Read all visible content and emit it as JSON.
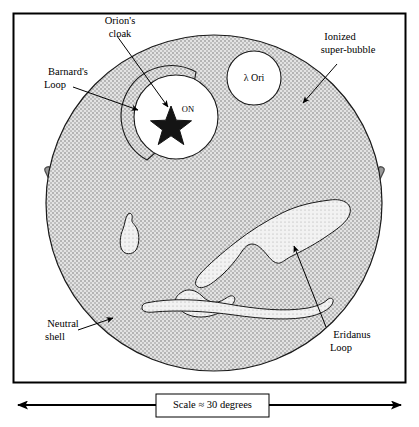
{
  "figure": {
    "frame_color": "#000000",
    "background_color": "#ffffff"
  },
  "colors": {
    "ionized_fill": "#d9d9d9",
    "stipple_dot": "#6e6e6e",
    "neutral_shell": "#9a9a9a",
    "neutral_shell_outline": "#4d4d4d",
    "outline": "#1a1a1a",
    "cavity_fill": "#ffffff",
    "star_fill": "#141414",
    "text": "#000000"
  },
  "labels": {
    "orions_cloak": "Orion's\ncloak",
    "orions_cloak_line1": "Orion's",
    "orions_cloak_line2": "cloak",
    "barnards_loop_line1": "Barnard's",
    "barnards_loop_line2": "Loop",
    "ionized_bubble_line1": "Ionized",
    "ionized_bubble_line2": "super-bubble",
    "lambda_ori": "λ Ori",
    "orion_nebula": "ON",
    "neutral_shell_line1": "Neutral",
    "neutral_shell_line2": "shell",
    "eridanus_loop_line1": "Eridanus",
    "eridanus_loop_line2": "Loop"
  },
  "scalebar": {
    "text": "Scale ≈ 30 degrees",
    "value": 30,
    "unit": "degrees",
    "approximate": true,
    "arrow_style": "double-headed"
  },
  "features": [
    {
      "name": "ionized-super-bubble",
      "kind": "circle",
      "description": "Large stippled circle filling most of the frame",
      "cx": 214,
      "cy": 203,
      "r": 168
    },
    {
      "name": "lambda-ori-cavity",
      "kind": "circle",
      "description": "Small white circular cavity upper right of centre",
      "cx": 254,
      "cy": 78,
      "r": 27
    },
    {
      "name": "orions-cloak-cavity",
      "kind": "circle",
      "description": "White circular cavity containing the Orion Nebula star",
      "cx": 176,
      "cy": 117,
      "r": 42
    },
    {
      "name": "barnards-loop",
      "kind": "arc",
      "description": "Stippled crescent arc hugging the left side of Orion's cloak cavity",
      "cx": 176,
      "cy": 117,
      "r": 50
    },
    {
      "name": "orion-nebula-star",
      "kind": "star",
      "description": "Filled five-pointed star marking the Orion Nebula",
      "cx": 171,
      "cy": 124,
      "r": 17
    },
    {
      "name": "small-filament-blob",
      "kind": "blob",
      "description": "Small irregular white blob left of centre-bottom",
      "cx": 131,
      "cy": 233
    },
    {
      "name": "eridanus-loop",
      "kind": "filament",
      "description": "Large elongated white filamentary loop running to the lower right",
      "cx": 280,
      "cy": 245
    },
    {
      "name": "lower-filament",
      "kind": "filament",
      "description": "Thin white filament near bottom of bubble",
      "cx": 225,
      "cy": 305
    },
    {
      "name": "neutral-shell",
      "kind": "arc",
      "description": "Thick grey arc outside the lower portion of the bubble",
      "cx": 214,
      "cy": 203,
      "r": 182
    }
  ]
}
